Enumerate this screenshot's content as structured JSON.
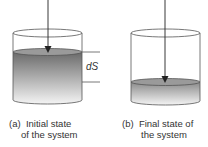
{
  "diagram": {
    "panels": [
      {
        "id": "a",
        "caption_line1": "(a)  Initial state",
        "caption_line2": "of the system",
        "liquid_level": "high"
      },
      {
        "id": "b",
        "caption_line1": "(b)  Final state of",
        "caption_line2": "the system",
        "liquid_level": "low"
      }
    ],
    "dimension_label": "dS",
    "colors": {
      "outline": "#555555",
      "liquid_dark": "#6a6a6a",
      "liquid_light": "#f2f2f2",
      "surface": "#9a9a9a",
      "arrow": "#222222"
    }
  }
}
